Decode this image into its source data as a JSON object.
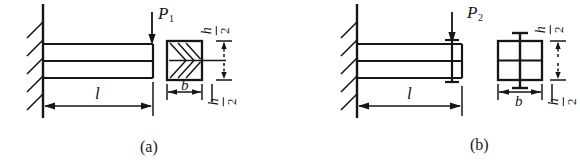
{
  "figure": {
    "type": "engineering-diagram",
    "panels": [
      {
        "id": "a",
        "caption": "(a)",
        "load_label": "P",
        "load_subscript": "1",
        "length_label": "l",
        "width_label": "b",
        "height_upper_label": {
          "numerator": "h",
          "denominator": "2"
        },
        "height_lower_label": {
          "numerator": "h",
          "denominator": "2"
        },
        "support": "fixed-wall-hatched",
        "cross_section": "two-stacked-bars-chevron-hatch"
      },
      {
        "id": "b",
        "caption": "(b)",
        "load_label": "P",
        "load_subscript": "2",
        "length_label": "l",
        "width_label": "b",
        "height_upper_label": {
          "numerator": "h",
          "denominator": "2"
        },
        "height_lower_label": {
          "numerator": "h",
          "denominator": "2"
        },
        "support": "fixed-wall-hatched",
        "cross_section": "two-stacked-bars-bolted"
      }
    ],
    "colors": {
      "line": "#161616",
      "background": "#ffffff"
    }
  }
}
